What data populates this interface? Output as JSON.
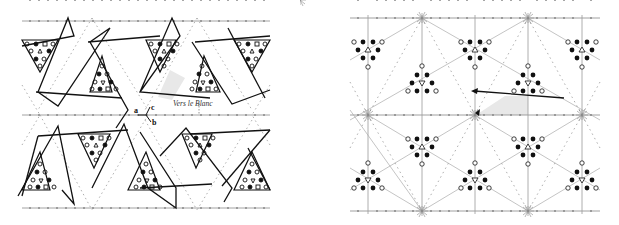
{
  "figure": {
    "panels": [
      {
        "id": "left",
        "description": "Tiling of interlocking triangular strips with zigzag arrows over dotted lattice lines",
        "labels": {
          "a": "a",
          "b": "b",
          "c": "c",
          "annotation": "Vers le Blanc"
        },
        "motif_symbols": [
          "open-circle",
          "filled-circle",
          "open-square",
          "open-triangle",
          "open-pentagon"
        ]
      },
      {
        "id": "right",
        "description": "Hexagonal symmetry lattice with star-shaped nodes and triangular clusters of circles",
        "motif_symbols": [
          "open-circle",
          "filled-circle",
          "open-triangle",
          "down-triangle"
        ]
      }
    ],
    "colors": {
      "ink": "#111111",
      "lattice": "#8a8a8a",
      "shade": "#e6e6e6"
    }
  }
}
